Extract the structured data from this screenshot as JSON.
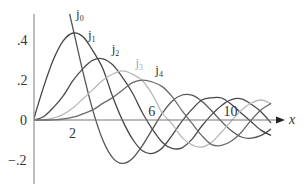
{
  "chart_data": {
    "type": "line",
    "title": "",
    "xlabel": "x",
    "ylabel": "",
    "xlim": [
      0,
      12.8
    ],
    "ylim": [
      -0.3,
      0.52
    ],
    "x_ticks": [
      "2",
      "6",
      "10"
    ],
    "x_tick_values": [
      2,
      6,
      10
    ],
    "y_ticks": [
      ".4",
      ".2",
      "0",
      "−.2"
    ],
    "y_tick_values": [
      0.4,
      0.2,
      0,
      -0.2
    ],
    "grid": false,
    "legend": "inline labels near curve peaks",
    "x": [
      0,
      0.5,
      1,
      1.5,
      2,
      2.5,
      3,
      3.5,
      4,
      4.5,
      5,
      5.5,
      6,
      6.5,
      7,
      7.5,
      8,
      8.5,
      9,
      9.5,
      10,
      10.5,
      11,
      11.5,
      12
    ],
    "series": [
      {
        "name": "j0",
        "label": "j",
        "sub": "0",
        "color": "#555555",
        "values": [
          1,
          0.959,
          0.841,
          0.665,
          0.455,
          0.239,
          0.047,
          -0.1,
          -0.189,
          -0.217,
          -0.192,
          -0.128,
          -0.047,
          0.033,
          0.094,
          0.125,
          0.124,
          0.094,
          0.046,
          -0.008,
          -0.054,
          -0.085,
          -0.091,
          -0.077,
          -0.045
        ]
      },
      {
        "name": "j1",
        "label": "j",
        "sub": "1",
        "color": "#444444",
        "values": [
          0,
          0.162,
          0.301,
          0.396,
          0.435,
          0.416,
          0.346,
          0.257,
          0.116,
          -0.003,
          -0.095,
          -0.154,
          -0.167,
          -0.14,
          -0.077,
          -0.006,
          0.053,
          0.1,
          0.111,
          0.11,
          0.078,
          0.034,
          -0.009,
          -0.052,
          -0.077
        ]
      },
      {
        "name": "j2",
        "label": "j",
        "sub": "2",
        "color": "#4a4a4a",
        "values": [
          0,
          0.016,
          0.062,
          0.121,
          0.198,
          0.257,
          0.299,
          0.306,
          0.276,
          0.212,
          0.135,
          0.036,
          -0.046,
          -0.111,
          -0.142,
          -0.139,
          -0.097,
          -0.03,
          0.027,
          0.073,
          0.102,
          0.106,
          0.079,
          0.04,
          -0.015
        ]
      },
      {
        "name": "j3",
        "label": "j",
        "sub": "3",
        "color": "#b8b8b8",
        "values": [
          0,
          0.001,
          0.009,
          0.028,
          0.061,
          0.106,
          0.152,
          0.199,
          0.23,
          0.246,
          0.229,
          0.196,
          0.128,
          0.035,
          -0.019,
          -0.087,
          -0.124,
          -0.135,
          -0.111,
          -0.06,
          -0.004,
          0.049,
          0.085,
          0.1,
          0.081
        ]
      },
      {
        "name": "j4",
        "label": "j",
        "sub": "4",
        "color": "#6a6a6a",
        "values": [
          0,
          0,
          0.001,
          0.005,
          0.014,
          0.031,
          0.051,
          0.083,
          0.112,
          0.15,
          0.187,
          0.199,
          0.19,
          0.167,
          0.117,
          0.047,
          -0.016,
          -0.078,
          -0.123,
          -0.127,
          -0.105,
          -0.061,
          0.0,
          0.051,
          0.083
        ]
      }
    ],
    "label_positions": [
      {
        "name": "j0",
        "x": 2.15,
        "y": 0.51
      },
      {
        "name": "j1",
        "x": 2.75,
        "y": 0.405
      },
      {
        "name": "j2",
        "x": 3.95,
        "y": 0.335
      },
      {
        "name": "j3",
        "x": 5.15,
        "y": 0.265
      },
      {
        "name": "j4",
        "x": 6.15,
        "y": 0.23
      }
    ],
    "j0_visible_from_x": 1.83
  },
  "axis": {
    "x_label": "x",
    "origin_label": "0"
  }
}
